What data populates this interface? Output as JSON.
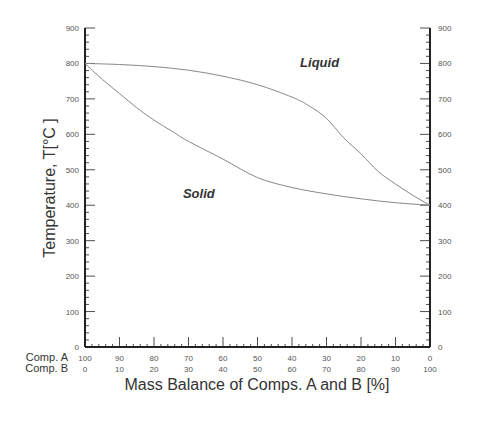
{
  "chart_data": {
    "type": "line",
    "title": "",
    "xlabel": "Mass Balance of Comps. A and B [%]",
    "ylabel": "Temperature, T[°C ]",
    "xlim": [
      0,
      100
    ],
    "ylim": [
      0,
      900
    ],
    "grid": false,
    "legend": "none",
    "y_ticks": [
      0,
      100,
      200,
      300,
      400,
      500,
      600,
      700,
      800,
      900
    ],
    "y_ticks_right": [
      0,
      100,
      200,
      300,
      400,
      500,
      600,
      700,
      800,
      900
    ],
    "x_rows": [
      {
        "label": "Comp. A",
        "ticks": [
          "100",
          "90",
          "80",
          "70",
          "60",
          "50",
          "40",
          "30",
          "20",
          "10",
          "0"
        ]
      },
      {
        "label": "Comp. B",
        "ticks": [
          "0",
          "10",
          "20",
          "30",
          "40",
          "50",
          "60",
          "70",
          "80",
          "90",
          "100"
        ]
      }
    ],
    "x_axis_variable": "Comp. B [%]",
    "series": [
      {
        "name": "Liquidus",
        "x": [
          0,
          10,
          20,
          30,
          40,
          50,
          60,
          65,
          70,
          75,
          80,
          85,
          90,
          95,
          100
        ],
        "y": [
          800,
          797,
          791,
          781,
          764,
          740,
          705,
          680,
          645,
          590,
          545,
          495,
          460,
          428,
          400
        ]
      },
      {
        "name": "Solidus",
        "x": [
          0,
          5,
          10,
          15,
          20,
          25,
          30,
          40,
          50,
          60,
          70,
          80,
          90,
          100
        ],
        "y": [
          800,
          755,
          715,
          675,
          640,
          610,
          580,
          530,
          478,
          450,
          432,
          418,
          407,
          400
        ]
      }
    ],
    "annotations": [
      {
        "text": "Liquid",
        "x": 68,
        "y": 790
      },
      {
        "text": "Solid",
        "x": 33,
        "y": 420
      }
    ]
  },
  "colors": {
    "axis": "#222222",
    "curve": "#888888",
    "text": "#333333"
  }
}
